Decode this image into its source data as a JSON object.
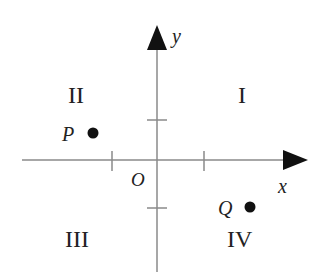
{
  "diagram": {
    "title": "",
    "axes": {
      "x_label": "x",
      "y_label": "y",
      "origin_label": "O"
    },
    "quadrants": [
      {
        "id": "I",
        "label": "I"
      },
      {
        "id": "II",
        "label": "II"
      },
      {
        "id": "III",
        "label": "III"
      },
      {
        "id": "IV",
        "label": "IV"
      }
    ],
    "points": [
      {
        "label": "P",
        "quadrant": "II"
      },
      {
        "label": "Q",
        "quadrant": "IV"
      }
    ],
    "colors": {
      "line": "#888888",
      "ink": "#222222"
    }
  }
}
